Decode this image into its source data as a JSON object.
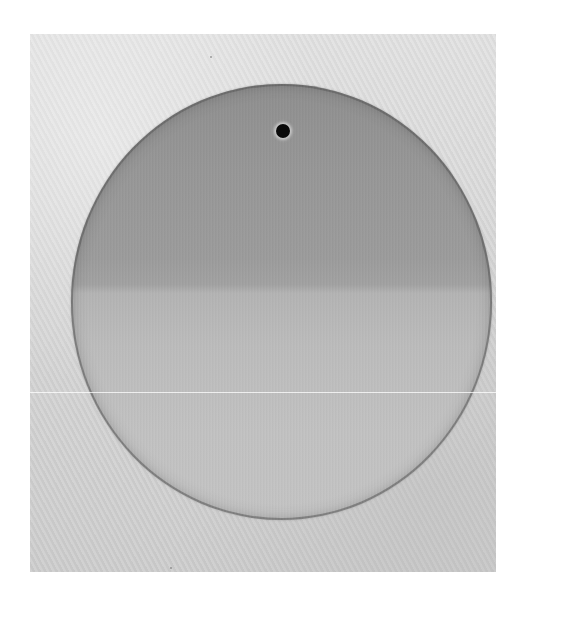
{
  "image": {
    "description": "Grayscale photograph of a circular disc on a textured light-gray surface, white margins around the photo",
    "subject": "circular-disc",
    "features": {
      "pinhole": "small dark hole near top center of disc",
      "gradient": "upper half darker gray, lower half lighter gray, with a transition band near middle",
      "scan_line": "thin horizontal white line across image around 60% height"
    },
    "colors": {
      "background_margin": "#ffffff",
      "surface": "#d8d8d8",
      "disc_top": "#8f8f8f",
      "disc_bottom": "#c4c4c4",
      "pinhole": "#0a0a0a"
    }
  }
}
